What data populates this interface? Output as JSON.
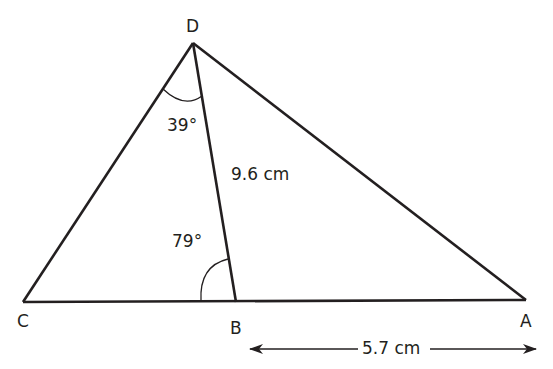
{
  "diagram": {
    "type": "geometry-triangle",
    "vertices": {
      "D": {
        "label": "D",
        "x": 193,
        "y": 43
      },
      "C": {
        "label": "C",
        "x": 23,
        "y": 302
      },
      "B": {
        "label": "B",
        "x": 236,
        "y": 302
      },
      "A": {
        "label": "A",
        "x": 526,
        "y": 300
      }
    },
    "segments": [
      "DC",
      "DA",
      "CA",
      "DB"
    ],
    "angles": {
      "CDB": {
        "label": "39°"
      },
      "DBC": {
        "label": "79°"
      }
    },
    "lengths": {
      "DB": {
        "label": "9.6 cm"
      },
      "BA": {
        "label": "5.7 cm"
      }
    },
    "colors": {
      "stroke": "#231f20",
      "background": "#ffffff"
    }
  }
}
